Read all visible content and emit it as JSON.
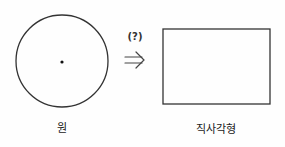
{
  "diagram": {
    "source_shape": {
      "label": "원",
      "type": "circle"
    },
    "transition": {
      "label": "(?)",
      "arrow": "⇒"
    },
    "target_shape": {
      "label": "직사각형",
      "type": "rectangle"
    }
  }
}
